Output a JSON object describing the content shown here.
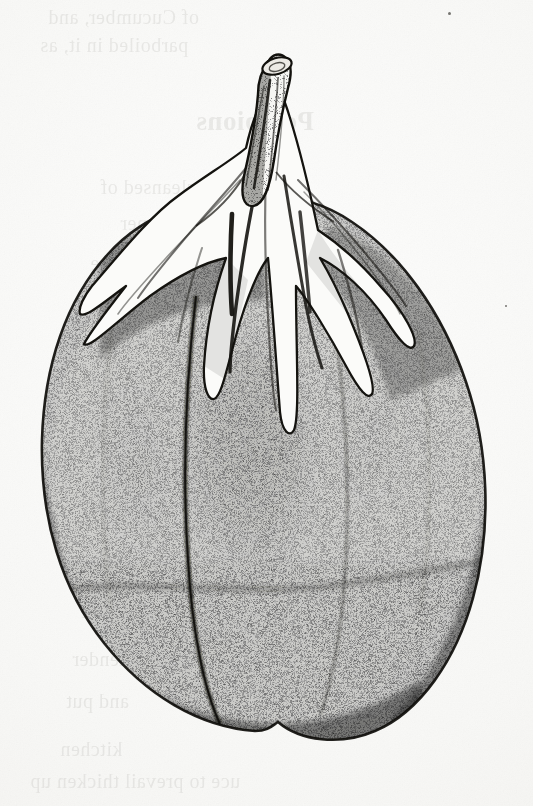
{
  "page": {
    "kind": "botanical-engraving-plate",
    "background_color": "#f8f8f6",
    "ink_color": "#1a1916",
    "width": 533,
    "height": 806
  },
  "illustration": {
    "subject": "eggplant",
    "common_name": "Eggplant",
    "alt_name": "Aubergine",
    "technique": "stipple engraving",
    "parts": [
      {
        "name": "stem",
        "label": "Stem (peduncle)"
      },
      {
        "name": "calyx",
        "label": "Calyx lobes"
      },
      {
        "name": "fruit-body",
        "label": "Fruit body"
      },
      {
        "name": "highlight",
        "label": "Specular highlight band"
      },
      {
        "name": "shadow",
        "label": "Lower shadow band"
      }
    ],
    "tone_stops": {
      "darkest": "#141310",
      "mid": "#4b4843",
      "light": "#bfbdb6",
      "paper": "#f8f8f6"
    }
  },
  "bleed_through": {
    "note": "faint mirrored show-through text from the reverse leaf",
    "lines": [
      {
        "id": "l1",
        "text": "of Cucumber, and",
        "x": 48,
        "y": 6,
        "size": 20,
        "weight": "normal"
      },
      {
        "id": "l2",
        "text": "parboiled in it, as",
        "x": 40,
        "y": 34,
        "size": 20,
        "weight": "normal"
      },
      {
        "id": "l3",
        "text": "Pompions",
        "x": 196,
        "y": 106,
        "size": 27,
        "weight": "bold"
      },
      {
        "id": "l4",
        "text": "When cleansed of",
        "x": 100,
        "y": 176,
        "size": 20,
        "weight": "normal"
      },
      {
        "id": "l5",
        "text": "the inner",
        "x": 120,
        "y": 212,
        "size": 20,
        "weight": "normal"
      },
      {
        "id": "l6",
        "text": "take",
        "x": 90,
        "y": 252,
        "size": 20,
        "weight": "normal"
      },
      {
        "id": "l7",
        "text": "and",
        "x": 104,
        "y": 292,
        "size": 20,
        "weight": "normal"
      },
      {
        "id": "l8",
        "text": "stew",
        "x": 96,
        "y": 330,
        "size": 20,
        "weight": "normal"
      },
      {
        "id": "l9",
        "text": "over",
        "x": 86,
        "y": 372,
        "size": 20,
        "weight": "normal"
      },
      {
        "id": "l10",
        "text": "rich",
        "x": 92,
        "y": 418,
        "size": 20,
        "weight": "normal"
      },
      {
        "id": "l11",
        "text": "a fine",
        "x": 80,
        "y": 600,
        "size": 20,
        "weight": "normal"
      },
      {
        "id": "l12",
        "text": "tender",
        "x": 72,
        "y": 648,
        "size": 20,
        "weight": "normal"
      },
      {
        "id": "l13",
        "text": "and put",
        "x": 66,
        "y": 690,
        "size": 20,
        "weight": "normal"
      },
      {
        "id": "l14",
        "text": "kitchen",
        "x": 60,
        "y": 738,
        "size": 20,
        "weight": "normal"
      },
      {
        "id": "l15",
        "text": "uce to prevail thicken up",
        "x": 30,
        "y": 770,
        "size": 20,
        "weight": "normal"
      }
    ],
    "specks": [
      {
        "id": "s1",
        "x": 448,
        "y": 12,
        "d": 3
      },
      {
        "id": "s2",
        "x": 116,
        "y": 452,
        "d": 2
      },
      {
        "id": "s3",
        "x": 505,
        "y": 305,
        "d": 2
      }
    ]
  }
}
